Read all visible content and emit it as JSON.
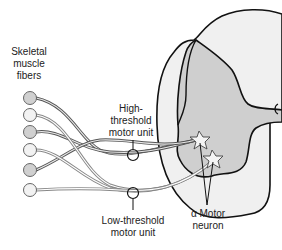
{
  "labels": {
    "muscle_fibers": [
      "Skeletal",
      "muscle",
      "fibers"
    ],
    "high_threshold": [
      "High-",
      "threshold",
      "motor unit"
    ],
    "low_threshold": [
      "Low-threshold",
      "motor unit"
    ],
    "alpha_motor": [
      "α Motor",
      "neuron"
    ]
  },
  "colors": {
    "cord_white_matter": "#f0f0f0",
    "cord_gray_matter": "#cfcfcf",
    "fiber_dark": "#d0d0d0",
    "fiber_light": "#f2f2f2",
    "outline": "#111111"
  }
}
